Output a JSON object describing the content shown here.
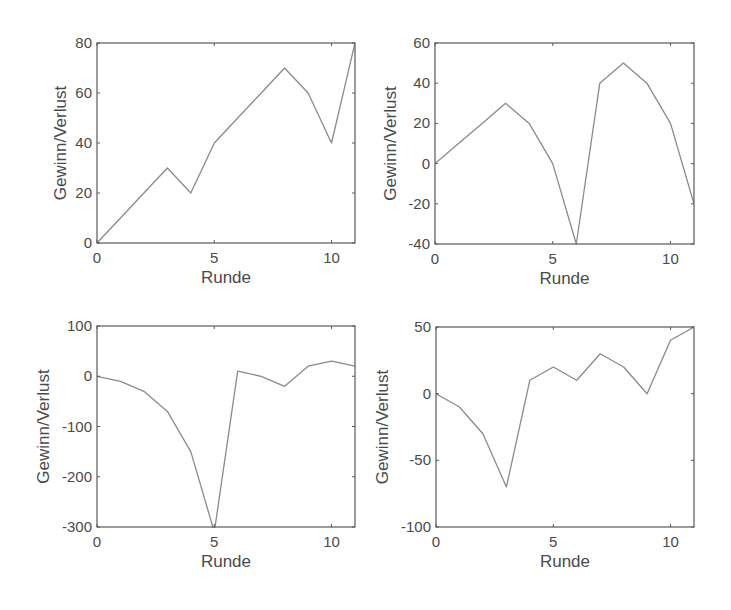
{
  "chart_data": [
    {
      "type": "line",
      "position": "top-left",
      "title": "",
      "xlabel": "Runde",
      "ylabel": "Gewinn/Verlust",
      "xlim": [
        0,
        11
      ],
      "ylim": [
        0,
        80
      ],
      "xticks": [
        0,
        5,
        10
      ],
      "yticks": [
        0,
        20,
        40,
        60,
        80
      ],
      "x": [
        0,
        1,
        2,
        3,
        4,
        5,
        6,
        7,
        8,
        9,
        10,
        11
      ],
      "y": [
        0,
        10,
        20,
        30,
        20,
        40,
        50,
        60,
        70,
        60,
        40,
        80
      ],
      "grid": false,
      "legend": null,
      "box": {
        "left": 97,
        "top": 43,
        "right": 355,
        "bottom": 243
      }
    },
    {
      "type": "line",
      "position": "top-right",
      "title": "",
      "xlabel": "Runde",
      "ylabel": "Gewinn/Verlust",
      "xlim": [
        0,
        11
      ],
      "ylim": [
        -40,
        60
      ],
      "xticks": [
        0,
        5,
        10
      ],
      "yticks": [
        -40,
        -20,
        0,
        20,
        40,
        60
      ],
      "x": [
        0,
        1,
        2,
        3,
        4,
        5,
        6,
        7,
        8,
        9,
        10,
        11
      ],
      "y": [
        0,
        10,
        20,
        30,
        20,
        0,
        -40,
        40,
        50,
        40,
        20,
        -20
      ],
      "grid": false,
      "legend": null,
      "box": {
        "left": 435,
        "top": 43,
        "right": 694,
        "bottom": 244
      }
    },
    {
      "type": "line",
      "position": "bottom-left",
      "title": "",
      "xlabel": "Runde",
      "ylabel": "Gewinn/Verlust",
      "xlim": [
        0,
        11
      ],
      "ylim": [
        -300,
        100
      ],
      "xticks": [
        0,
        5,
        10
      ],
      "yticks": [
        -300,
        -200,
        -100,
        0,
        100
      ],
      "x": [
        0,
        1,
        2,
        3,
        4,
        5,
        6,
        7,
        8,
        9,
        10,
        11
      ],
      "y": [
        0,
        -10,
        -30,
        -70,
        -150,
        -310,
        10,
        0,
        -20,
        20,
        30,
        20
      ],
      "grid": false,
      "legend": null,
      "box": {
        "left": 97,
        "top": 326,
        "right": 355,
        "bottom": 527
      }
    },
    {
      "type": "line",
      "position": "bottom-right",
      "title": "",
      "xlabel": "Runde",
      "ylabel": "Gewinn/Verlust",
      "xlim": [
        0,
        11
      ],
      "ylim": [
        -100,
        50
      ],
      "xticks": [
        0,
        5,
        10
      ],
      "yticks": [
        -100,
        -50,
        0,
        50
      ],
      "x": [
        0,
        1,
        2,
        3,
        4,
        5,
        6,
        7,
        8,
        9,
        10,
        11
      ],
      "y": [
        0,
        -10,
        -30,
        -70,
        10,
        20,
        10,
        30,
        20,
        0,
        40,
        50
      ],
      "grid": false,
      "legend": null,
      "box": {
        "left": 436,
        "top": 327,
        "right": 694,
        "bottom": 527
      }
    }
  ],
  "colors": {
    "line": "#8a8a8a",
    "frame": "#5a5a5a",
    "text": "#4a4a4a",
    "background": "#ffffff"
  }
}
